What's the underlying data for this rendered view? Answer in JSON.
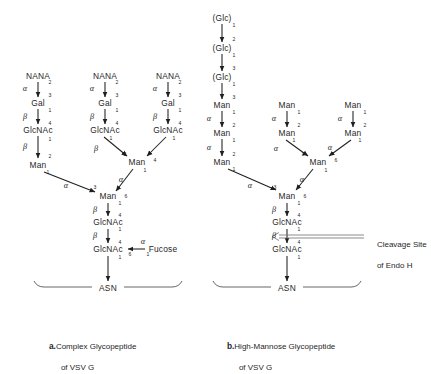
{
  "figure": {
    "type": "biochemical-structure-diagram",
    "background": "#ffffff",
    "ink": "#1f1f1f"
  },
  "panel_a": {
    "caption_label": "a.",
    "caption_line1": "Complex Glycopeptide",
    "caption_line2": "of VSV G",
    "nodes": [
      {
        "id": "a_nana1",
        "label": "NANA",
        "x": 38,
        "y": 76
      },
      {
        "id": "a_gal1",
        "label": "Gal",
        "x": 38,
        "y": 103
      },
      {
        "id": "a_gn1",
        "label": "GlcNAc",
        "x": 38,
        "y": 130
      },
      {
        "id": "a_man1",
        "label": "Man",
        "x": 38,
        "y": 165
      },
      {
        "id": "a_nana2",
        "label": "NANA",
        "x": 105,
        "y": 76
      },
      {
        "id": "a_gal2",
        "label": "Gal",
        "x": 105,
        "y": 103
      },
      {
        "id": "a_gn2",
        "label": "GlcNAc",
        "x": 105,
        "y": 130
      },
      {
        "id": "a_nana3",
        "label": "NANA",
        "x": 168,
        "y": 76
      },
      {
        "id": "a_gal3",
        "label": "Gal",
        "x": 168,
        "y": 103
      },
      {
        "id": "a_gn3",
        "label": "GlcNAc",
        "x": 168,
        "y": 130
      },
      {
        "id": "a_man2",
        "label": "Man",
        "x": 137,
        "y": 162
      },
      {
        "id": "a_man3",
        "label": "Man",
        "x": 108,
        "y": 196
      },
      {
        "id": "a_gn4",
        "label": "GlcNAc",
        "x": 108,
        "y": 222
      },
      {
        "id": "a_gn5",
        "label": "GlcNAc",
        "x": 108,
        "y": 249
      },
      {
        "id": "a_fuc",
        "label": "Fucose",
        "x": 163,
        "y": 249
      },
      {
        "id": "a_asn",
        "label": "ASN",
        "x": 108,
        "y": 288
      }
    ],
    "anomers": [
      {
        "sym": "α",
        "x": 25,
        "y": 89
      },
      {
        "sym": "β",
        "x": 25,
        "y": 117
      },
      {
        "sym": "β",
        "x": 25,
        "y": 147
      },
      {
        "sym": "α",
        "x": 92,
        "y": 89
      },
      {
        "sym": "β",
        "x": 92,
        "y": 117
      },
      {
        "sym": "β",
        "x": 96,
        "y": 149
      },
      {
        "sym": "α",
        "x": 155,
        "y": 89
      },
      {
        "sym": "β",
        "x": 155,
        "y": 117
      },
      {
        "sym": "α",
        "x": 66,
        "y": 186
      },
      {
        "sym": "α",
        "x": 121,
        "y": 180
      },
      {
        "sym": "β",
        "x": 95,
        "y": 210
      },
      {
        "sym": "β",
        "x": 95,
        "y": 236
      },
      {
        "sym": "α",
        "x": 143,
        "y": 242
      }
    ],
    "numbers": [
      {
        "v": "2",
        "x": 50,
        "y": 83
      },
      {
        "v": "3",
        "x": 50,
        "y": 96
      },
      {
        "v": "1",
        "x": 50,
        "y": 111
      },
      {
        "v": "4",
        "x": 50,
        "y": 124
      },
      {
        "v": "1",
        "x": 50,
        "y": 140
      },
      {
        "v": "2",
        "x": 50,
        "y": 157
      },
      {
        "v": "2",
        "x": 117,
        "y": 83
      },
      {
        "v": "3",
        "x": 117,
        "y": 96
      },
      {
        "v": "1",
        "x": 117,
        "y": 111
      },
      {
        "v": "4",
        "x": 117,
        "y": 124
      },
      {
        "v": "1",
        "x": 111,
        "y": 139
      },
      {
        "v": "2",
        "x": 125,
        "y": 155
      },
      {
        "v": "2",
        "x": 180,
        "y": 83
      },
      {
        "v": "3",
        "x": 180,
        "y": 96
      },
      {
        "v": "1",
        "x": 180,
        "y": 111
      },
      {
        "v": "4",
        "x": 180,
        "y": 124
      },
      {
        "v": "1",
        "x": 174,
        "y": 139
      },
      {
        "v": "4",
        "x": 155,
        "y": 161
      },
      {
        "v": "1",
        "x": 145,
        "y": 171
      },
      {
        "v": "1",
        "x": 48,
        "y": 173
      },
      {
        "v": "3",
        "x": 95,
        "y": 188
      },
      {
        "v": "6",
        "x": 126,
        "y": 197
      },
      {
        "v": "1",
        "x": 120,
        "y": 204
      },
      {
        "v": "4",
        "x": 120,
        "y": 216
      },
      {
        "v": "1",
        "x": 120,
        "y": 230
      },
      {
        "v": "4",
        "x": 120,
        "y": 243
      },
      {
        "v": "6",
        "x": 130,
        "y": 255
      },
      {
        "v": "1",
        "x": 148,
        "y": 255
      },
      {
        "v": "1",
        "x": 120,
        "y": 258
      }
    ]
  },
  "panel_b": {
    "caption_label": "b.",
    "caption_line1": "High-Mannose Glycopeptide",
    "caption_line2": "of VSV G",
    "cleavage_line1": "Cleavage Site",
    "cleavage_line2": "of Endo H",
    "nodes": [
      {
        "id": "b_glc1",
        "label": "(Glc)",
        "x": 222,
        "y": 18
      },
      {
        "id": "b_glc2",
        "label": "(Glc)",
        "x": 222,
        "y": 48
      },
      {
        "id": "b_glc3",
        "label": "(Glc)",
        "x": 222,
        "y": 77
      },
      {
        "id": "b_man1",
        "label": "Man",
        "x": 222,
        "y": 105
      },
      {
        "id": "b_man2",
        "label": "Man",
        "x": 222,
        "y": 133
      },
      {
        "id": "b_man3",
        "label": "Man",
        "x": 222,
        "y": 162
      },
      {
        "id": "b_man4",
        "label": "Man",
        "x": 287,
        "y": 105
      },
      {
        "id": "b_man5",
        "label": "Man",
        "x": 287,
        "y": 133
      },
      {
        "id": "b_man6",
        "label": "Man",
        "x": 353,
        "y": 105
      },
      {
        "id": "b_man7",
        "label": "Man",
        "x": 353,
        "y": 133
      },
      {
        "id": "b_man8",
        "label": "Man",
        "x": 318,
        "y": 162
      },
      {
        "id": "b_man9",
        "label": "Man",
        "x": 287,
        "y": 196
      },
      {
        "id": "b_gn1",
        "label": "GlcNAc",
        "x": 287,
        "y": 222
      },
      {
        "id": "b_gn2",
        "label": "GlcNAc",
        "x": 287,
        "y": 249
      },
      {
        "id": "b_asn",
        "label": "ASN",
        "x": 287,
        "y": 288
      }
    ],
    "anomers": [
      {
        "sym": "α",
        "x": 209,
        "y": 119
      },
      {
        "sym": "α",
        "x": 209,
        "y": 148
      },
      {
        "sym": "α",
        "x": 274,
        "y": 119
      },
      {
        "sym": "α",
        "x": 340,
        "y": 119
      },
      {
        "sym": "α",
        "x": 250,
        "y": 186
      },
      {
        "sym": "α",
        "x": 276,
        "y": 149
      },
      {
        "sym": "α",
        "x": 330,
        "y": 148
      },
      {
        "sym": "α",
        "x": 302,
        "y": 180
      },
      {
        "sym": "β",
        "x": 274,
        "y": 210
      },
      {
        "sym": "β",
        "x": 274,
        "y": 236
      }
    ],
    "numbers": [
      {
        "v": "1",
        "x": 234,
        "y": 26
      },
      {
        "v": "2",
        "x": 234,
        "y": 40
      },
      {
        "v": "1",
        "x": 234,
        "y": 56
      },
      {
        "v": "3",
        "x": 234,
        "y": 69
      },
      {
        "v": "1",
        "x": 234,
        "y": 85
      },
      {
        "v": "3",
        "x": 234,
        "y": 98
      },
      {
        "v": "1",
        "x": 234,
        "y": 113
      },
      {
        "v": "2",
        "x": 234,
        "y": 126
      },
      {
        "v": "1",
        "x": 234,
        "y": 141
      },
      {
        "v": "2",
        "x": 234,
        "y": 155
      },
      {
        "v": "1",
        "x": 234,
        "y": 170
      },
      {
        "v": "1",
        "x": 299,
        "y": 113
      },
      {
        "v": "2",
        "x": 299,
        "y": 126
      },
      {
        "v": "1",
        "x": 294,
        "y": 141
      },
      {
        "v": "1",
        "x": 365,
        "y": 113
      },
      {
        "v": "2",
        "x": 365,
        "y": 126
      },
      {
        "v": "1",
        "x": 360,
        "y": 141
      },
      {
        "v": "3",
        "x": 303,
        "y": 155
      },
      {
        "v": "6",
        "x": 336,
        "y": 161
      },
      {
        "v": "1",
        "x": 326,
        "y": 171
      },
      {
        "v": "3",
        "x": 275,
        "y": 188
      },
      {
        "v": "6",
        "x": 305,
        "y": 197
      },
      {
        "v": "1",
        "x": 299,
        "y": 204
      },
      {
        "v": "4",
        "x": 299,
        "y": 216
      },
      {
        "v": "1",
        "x": 299,
        "y": 230
      },
      {
        "v": "4",
        "x": 299,
        "y": 243
      },
      {
        "v": "1",
        "x": 299,
        "y": 258
      }
    ]
  }
}
